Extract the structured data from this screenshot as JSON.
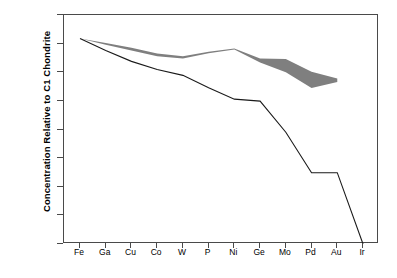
{
  "chart_data": {
    "type": "area",
    "title": "",
    "subtitle": "",
    "xlabel": "",
    "ylabel": "Concentration Relative to C1 Chondrite",
    "categories": [
      "Fe",
      "Ga",
      "Cu",
      "Co",
      "W",
      "P",
      "Ni",
      "Ge",
      "Mo",
      "Pd",
      "Au",
      "Ir"
    ],
    "xtick_labels": [
      "Fe",
      "Ga",
      "Cu",
      "Co",
      "W",
      "P",
      "Ni",
      "Ge",
      "Mo",
      "Pd",
      "Au",
      "Ir"
    ],
    "ytick_labels": [
      "10⁰",
      "10⁻¹",
      "10⁻²",
      "10⁻³",
      "10⁻⁴",
      "10⁻⁵",
      "10⁻⁶",
      "10⁻⁷",
      "10⁻⁸"
    ],
    "ytick_values": [
      1,
      0.1,
      0.01,
      0.001,
      0.0001,
      1e-05,
      1e-06,
      1e-07,
      1e-08
    ],
    "yscale": "log",
    "ylim": [
      1e-08,
      1
    ],
    "grid": false,
    "legend": "none",
    "series": [
      {
        "name": "Model curve",
        "type": "line",
        "color": "#1a1a1a",
        "linewidth": 1.1,
        "values": [
          0.15,
          0.058,
          0.024,
          0.0125,
          0.0078,
          0.0029,
          0.00115,
          0.00098,
          8e-05,
          3.1e-06,
          3.1e-06,
          1e-08
        ]
      },
      {
        "name": "Measured range band",
        "type": "band",
        "color": "#7f7f7f",
        "upper": [
          0.15,
          0.105,
          0.072,
          0.045,
          0.036,
          0.052,
          0.068,
          0.03,
          0.029,
          0.0105,
          0.006,
          null
        ],
        "lower": [
          0.15,
          0.092,
          0.058,
          0.036,
          0.03,
          0.046,
          0.062,
          0.022,
          0.01,
          0.0028,
          0.0046,
          null
        ]
      }
    ],
    "annotations": []
  },
  "figure": {
    "background_color": "#ffffff",
    "frame_color": "#4a4a4a",
    "band_color": "#7f7f7f",
    "line_color": "#1a1a1a"
  }
}
